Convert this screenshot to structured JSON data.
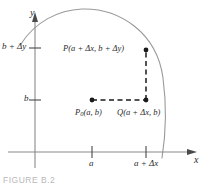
{
  "figure": {
    "caption": "FIGURE B.2",
    "axes": {
      "x_axis_name": "x",
      "y_axis_name": "y"
    },
    "x_ticks": [
      {
        "label": "a",
        "value": 92
      },
      {
        "label": "a + Δx",
        "value": 146
      }
    ],
    "y_ticks": [
      {
        "label": "b",
        "value": 100
      },
      {
        "label": "b + Δy",
        "value": 48
      }
    ],
    "points": [
      {
        "id": "P0",
        "name_part": "P",
        "subscript": "0",
        "coords_text": "(a, b)",
        "full_label": "P₀(a, b)"
      },
      {
        "id": "Q",
        "name_part": "Q",
        "subscript": "",
        "coords_text": "(a + Δx, b)",
        "full_label": "Q(a + Δx, b)"
      },
      {
        "id": "P",
        "name_part": "P",
        "subscript": "",
        "coords_text": "(a + Δx, b + Δy)",
        "full_label": "P(a + Δx, b + Δy)"
      }
    ],
    "colors": {
      "axis": "#8a8a8a",
      "curve": "#9a9a9a",
      "dashed": "#2b2b2b",
      "dot": "#1a1a1a",
      "text": "#2b2b2b",
      "caption": "#b9b9b9",
      "background": "#ffffff"
    }
  }
}
